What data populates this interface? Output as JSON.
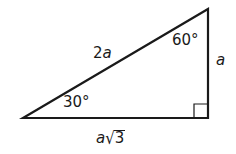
{
  "figure": {
    "type": "30-60-90 right triangle",
    "stroke_color": "#1a1a1a",
    "background": "#ffffff",
    "vertices": {
      "left_acute": {
        "x": 23,
        "y": 118
      },
      "top": {
        "x": 208,
        "y": 9
      },
      "right_angle": {
        "x": 208,
        "y": 118
      }
    },
    "right_angle_marker_size": 14
  },
  "labels": {
    "hypotenuse": {
      "var": "2",
      "italic": "a"
    },
    "angle_top": "60°",
    "angle_left": "30°",
    "vertical_side": "a",
    "base_side": {
      "coef": "a",
      "radical": "√",
      "radicand": "3"
    }
  }
}
